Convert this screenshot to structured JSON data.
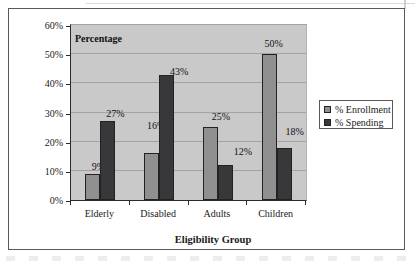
{
  "chart_data": {
    "type": "bar",
    "title": "Percentage",
    "xlabel": "Eligibility Group",
    "categories": [
      "Elderly",
      "Disabled",
      "Adults",
      "Children"
    ],
    "series": [
      {
        "name": "% Enrollment",
        "color": "#909090",
        "values": [
          9,
          16,
          25,
          50
        ],
        "labels": [
          "9%",
          "16%",
          "25%",
          "50%"
        ],
        "label_dx": [
          -2,
          -3,
          3,
          -3
        ],
        "label_dy": [
          0,
          -20,
          -3,
          -3
        ]
      },
      {
        "name": "% Spending",
        "color": "#38383a",
        "values": [
          27,
          43,
          12,
          18
        ],
        "labels": [
          "27%",
          "43%",
          "12%",
          "18%"
        ],
        "label_dx": [
          0,
          5,
          10,
          3
        ],
        "label_dy": [
          0,
          4,
          -6,
          -9
        ]
      }
    ],
    "ylim": [
      0,
      60
    ],
    "y_ticks": [
      "0%",
      "10%",
      "20%",
      "30%",
      "40%",
      "50%",
      "60%"
    ],
    "grid": true,
    "legend_position": "right",
    "plot_bg": "#c9c9c9",
    "colors": {
      "gridline": "#a3a3a3",
      "axis": "#2b2b2b",
      "frame": "#595959",
      "text": "#1a1a1a"
    }
  }
}
